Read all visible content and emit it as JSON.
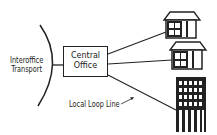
{
  "diagram": {
    "type": "telecom-network",
    "labels": {
      "interoffice_line1": "Interoffice",
      "interoffice_line2": "Transport",
      "central_office_line1": "Central",
      "central_office_line2": "Office",
      "local_loop": "Local Loop Line"
    },
    "nodes": [
      {
        "id": "interoffice-transport",
        "shape": "arc"
      },
      {
        "id": "central-office",
        "shape": "box"
      },
      {
        "id": "house-1",
        "shape": "house-icon"
      },
      {
        "id": "house-2",
        "shape": "house-icon"
      },
      {
        "id": "office-building",
        "shape": "building-icon"
      }
    ],
    "edges": [
      {
        "from": "interoffice-transport",
        "to": "central-office"
      },
      {
        "from": "central-office",
        "to": "house-1"
      },
      {
        "from": "central-office",
        "to": "house-2"
      },
      {
        "from": "central-office",
        "to": "office-building"
      }
    ],
    "colors": {
      "stroke": "#222222",
      "background": "#ffffff"
    }
  }
}
